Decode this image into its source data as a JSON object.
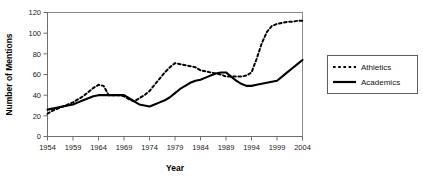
{
  "chart_data": {
    "type": "line",
    "title": "",
    "xlabel": "Year",
    "ylabel": "Number of Mentions",
    "xlim": [
      1954,
      2004
    ],
    "ylim": [
      0,
      120
    ],
    "ytick_step": 20,
    "xtick_step": 5,
    "grid": false,
    "legend_position": "right",
    "categories": [
      1954,
      1955,
      1956,
      1957,
      1958,
      1959,
      1960,
      1961,
      1962,
      1963,
      1964,
      1965,
      1966,
      1967,
      1968,
      1969,
      1970,
      1971,
      1972,
      1973,
      1974,
      1975,
      1976,
      1977,
      1978,
      1979,
      1980,
      1981,
      1982,
      1983,
      1984,
      1985,
      1986,
      1987,
      1988,
      1989,
      1990,
      1991,
      1992,
      1993,
      1994,
      1995,
      1996,
      1997,
      1998,
      1999,
      2000,
      2001,
      2002,
      2003,
      2004
    ],
    "series": [
      {
        "name": "Athletics",
        "style": "dashed",
        "color": "#000000",
        "values": [
          22,
          25,
          27,
          29,
          31,
          33,
          36,
          39,
          43,
          47,
          50,
          49,
          40,
          40,
          40,
          39,
          36,
          34,
          37,
          40,
          44,
          50,
          56,
          62,
          67,
          71,
          70,
          69,
          68,
          67,
          64,
          63,
          62,
          61,
          60,
          58,
          58,
          58,
          58,
          59,
          62,
          75,
          90,
          101,
          107,
          109,
          110,
          111,
          111,
          112,
          112
        ]
      },
      {
        "name": "Academics",
        "style": "solid",
        "color": "#000000",
        "values": [
          26,
          27,
          28,
          29,
          30,
          31,
          33,
          35,
          37,
          39,
          40,
          40,
          40,
          40,
          40,
          40,
          37,
          34,
          31,
          30,
          29,
          31,
          33,
          35,
          38,
          42,
          46,
          49,
          52,
          54,
          55,
          57,
          59,
          61,
          62,
          62,
          58,
          54,
          51,
          49,
          49,
          50,
          51,
          52,
          53,
          54,
          58,
          62,
          66,
          70,
          74
        ]
      }
    ],
    "ytick_labels": [
      "0",
      "20",
      "40",
      "60",
      "80",
      "100",
      "120"
    ],
    "xtick_labels": [
      "1954",
      "1959",
      "1964",
      "1969",
      "1974",
      "1979",
      "1984",
      "1989",
      "1994",
      "1999",
      "2004"
    ]
  },
  "legend": {
    "entries": [
      {
        "label": "Athletics",
        "style": "dashed"
      },
      {
        "label": "Academics",
        "style": "solid"
      }
    ]
  }
}
